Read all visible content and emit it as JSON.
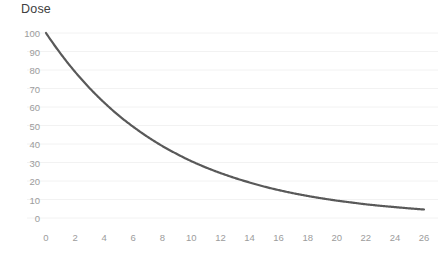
{
  "chart_data": {
    "type": "line",
    "title": "Dose",
    "xlabel": "",
    "ylabel": "",
    "xlim": [
      0,
      26
    ],
    "ylim": [
      0,
      100
    ],
    "grid": "horizontal",
    "legend": "none",
    "line_color": "#595959",
    "grid_color": "#f2f2f2",
    "tick_label_color": "#9c9c9c",
    "title_color": "#404040",
    "background": "#ffffff",
    "x_ticks": [
      0,
      2,
      4,
      6,
      8,
      10,
      12,
      14,
      16,
      18,
      20,
      22,
      24,
      26
    ],
    "y_ticks": [
      0,
      10,
      20,
      30,
      40,
      50,
      60,
      70,
      80,
      90,
      100
    ],
    "series": [
      {
        "name": "Dose",
        "x": [
          0,
          1,
          2,
          3,
          4,
          5,
          6,
          7,
          8,
          9,
          10,
          11,
          12,
          13,
          14,
          15,
          16,
          17,
          18,
          19,
          20,
          21,
          22,
          23,
          24,
          25,
          26
        ],
        "values": [
          100,
          88.9,
          79.0,
          70.2,
          62.4,
          55.4,
          49.3,
          43.8,
          38.9,
          34.6,
          30.7,
          27.3,
          24.3,
          21.6,
          19.2,
          17.0,
          15.1,
          13.4,
          11.9,
          10.6,
          9.4,
          8.4,
          7.4,
          6.6,
          5.9,
          5.2,
          4.6
        ]
      }
    ]
  }
}
